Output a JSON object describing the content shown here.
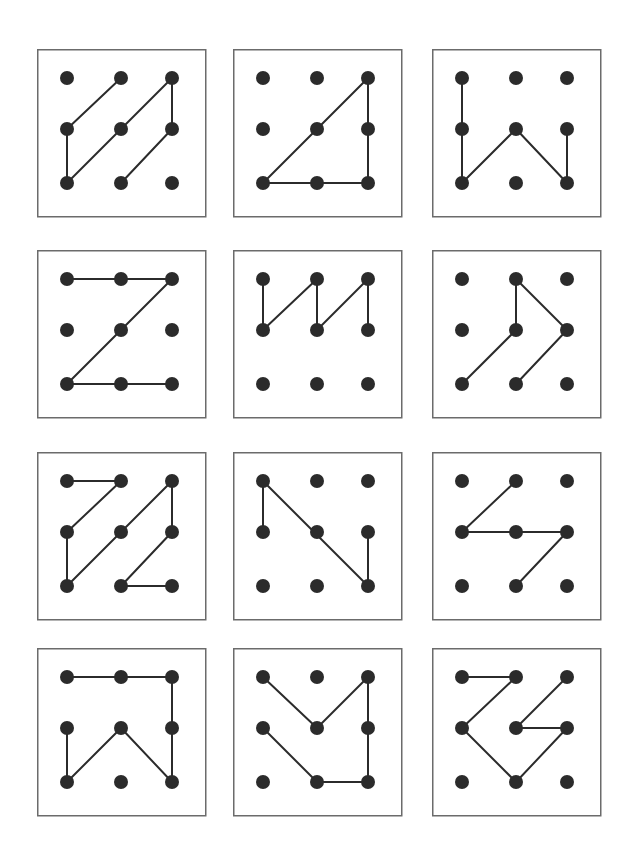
{
  "page": {
    "background_color": "#ffffff",
    "width": 639,
    "height": 857
  },
  "style": {
    "dot_color": "#2b2b2b",
    "line_color": "#2b2b2b",
    "border_color": "#6b6b6b",
    "dot_radius": 7,
    "line_width": 2,
    "border_width": 1.5
  },
  "layout": {
    "columns": 3,
    "rows": 4,
    "panel_width": 168,
    "panel_height": 167,
    "panel_origins_x": [
      37,
      233,
      432
    ],
    "panel_origins_y": [
      49,
      250,
      452,
      648
    ],
    "dot_offsets_x": [
      30,
      84,
      135
    ],
    "dot_offsets_y": [
      29,
      80,
      134
    ],
    "grid_cols": 3,
    "grid_rows": 3
  },
  "chart_data": {
    "type": "diagram-grid",
    "panel_count": 12,
    "panels": [
      {
        "index": 1,
        "name": "panel-1",
        "label": "double diagonal slashes",
        "segments": [
          [
            [
              0,
              1
            ],
            [
              1,
              0
            ]
          ],
          [
            [
              0,
              1
            ],
            [
              0,
              2
            ]
          ],
          [
            [
              0,
              2
            ],
            [
              2,
              0
            ]
          ],
          [
            [
              2,
              0
            ],
            [
              2,
              1
            ]
          ],
          [
            [
              1,
              2
            ],
            [
              2,
              1
            ]
          ]
        ]
      },
      {
        "index": 2,
        "name": "panel-2",
        "label": "right triangle",
        "segments": [
          [
            [
              0,
              2
            ],
            [
              2,
              0
            ]
          ],
          [
            [
              2,
              0
            ],
            [
              2,
              2
            ]
          ],
          [
            [
              0,
              2
            ],
            [
              2,
              2
            ]
          ]
        ]
      },
      {
        "index": 3,
        "name": "panel-3",
        "label": "letter W",
        "segments": [
          [
            [
              0,
              0
            ],
            [
              0,
              2
            ]
          ],
          [
            [
              0,
              2
            ],
            [
              1,
              1
            ]
          ],
          [
            [
              1,
              1
            ],
            [
              2,
              2
            ]
          ],
          [
            [
              2,
              2
            ],
            [
              2,
              1
            ]
          ]
        ]
      },
      {
        "index": 4,
        "name": "panel-4",
        "label": "letter Z",
        "segments": [
          [
            [
              0,
              0
            ],
            [
              2,
              0
            ]
          ],
          [
            [
              2,
              0
            ],
            [
              0,
              2
            ]
          ],
          [
            [
              0,
              2
            ],
            [
              2,
              2
            ]
          ]
        ]
      },
      {
        "index": 5,
        "name": "panel-5",
        "label": "zigzag W top rows",
        "segments": [
          [
            [
              0,
              0
            ],
            [
              0,
              1
            ]
          ],
          [
            [
              0,
              1
            ],
            [
              1,
              0
            ]
          ],
          [
            [
              1,
              0
            ],
            [
              1,
              1
            ]
          ],
          [
            [
              1,
              1
            ],
            [
              2,
              0
            ]
          ],
          [
            [
              2,
              0
            ],
            [
              2,
              1
            ]
          ]
        ]
      },
      {
        "index": 6,
        "name": "panel-6",
        "label": "arrowhead zigzag",
        "segments": [
          [
            [
              0,
              2
            ],
            [
              1,
              1
            ]
          ],
          [
            [
              1,
              1
            ],
            [
              1,
              0
            ]
          ],
          [
            [
              1,
              0
            ],
            [
              2,
              1
            ]
          ],
          [
            [
              2,
              1
            ],
            [
              1,
              2
            ]
          ]
        ]
      },
      {
        "index": 7,
        "name": "panel-7",
        "label": "two letter Z shapes",
        "segments": [
          [
            [
              0,
              0
            ],
            [
              1,
              0
            ]
          ],
          [
            [
              1,
              0
            ],
            [
              0,
              1
            ]
          ],
          [
            [
              0,
              1
            ],
            [
              0,
              2
            ]
          ],
          [
            [
              0,
              2
            ],
            [
              2,
              0
            ]
          ],
          [
            [
              2,
              0
            ],
            [
              2,
              1
            ]
          ],
          [
            [
              2,
              1
            ],
            [
              1,
              2
            ]
          ],
          [
            [
              1,
              2
            ],
            [
              2,
              2
            ]
          ]
        ]
      },
      {
        "index": 8,
        "name": "panel-8",
        "label": "letter N mirrored",
        "segments": [
          [
            [
              0,
              0
            ],
            [
              0,
              1
            ]
          ],
          [
            [
              0,
              0
            ],
            [
              2,
              2
            ]
          ],
          [
            [
              2,
              1
            ],
            [
              2,
              2
            ]
          ]
        ]
      },
      {
        "index": 9,
        "name": "panel-9",
        "label": "arrow pointing left",
        "segments": [
          [
            [
              1,
              0
            ],
            [
              0,
              1
            ]
          ],
          [
            [
              0,
              1
            ],
            [
              2,
              1
            ]
          ],
          [
            [
              2,
              1
            ],
            [
              1,
              2
            ]
          ]
        ]
      },
      {
        "index": 10,
        "name": "panel-10",
        "label": "bracket with W",
        "segments": [
          [
            [
              0,
              0
            ],
            [
              2,
              0
            ]
          ],
          [
            [
              2,
              0
            ],
            [
              2,
              2
            ]
          ],
          [
            [
              0,
              1
            ],
            [
              0,
              2
            ]
          ],
          [
            [
              0,
              2
            ],
            [
              1,
              1
            ]
          ],
          [
            [
              1,
              1
            ],
            [
              2,
              2
            ]
          ]
        ]
      },
      {
        "index": 11,
        "name": "panel-11",
        "label": "V with hook",
        "segments": [
          [
            [
              0,
              0
            ],
            [
              1,
              1
            ]
          ],
          [
            [
              1,
              1
            ],
            [
              2,
              0
            ]
          ],
          [
            [
              2,
              0
            ],
            [
              2,
              2
            ]
          ],
          [
            [
              0,
              1
            ],
            [
              1,
              2
            ]
          ],
          [
            [
              1,
              2
            ],
            [
              2,
              2
            ]
          ]
        ]
      },
      {
        "index": 12,
        "name": "panel-12",
        "label": "two interlocking Z shapes",
        "segments": [
          [
            [
              0,
              0
            ],
            [
              1,
              0
            ]
          ],
          [
            [
              1,
              0
            ],
            [
              0,
              1
            ]
          ],
          [
            [
              0,
              1
            ],
            [
              1,
              2
            ]
          ],
          [
            [
              1,
              2
            ],
            [
              2,
              1
            ]
          ],
          [
            [
              2,
              1
            ],
            [
              1,
              1
            ]
          ],
          [
            [
              1,
              1
            ],
            [
              2,
              0
            ]
          ]
        ]
      }
    ]
  }
}
